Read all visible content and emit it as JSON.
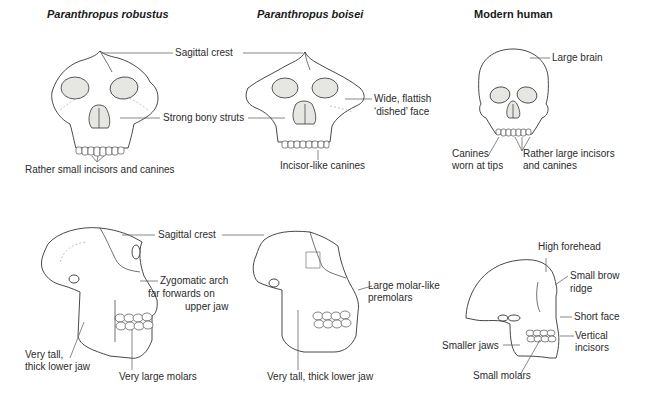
{
  "columns": [
    {
      "title": "Paranthropus robustus",
      "italic": true
    },
    {
      "title": "Paranthropus boisei",
      "italic": true
    },
    {
      "title": "Modern human",
      "italic": false
    }
  ],
  "front_view": {
    "shared_labels": {
      "sagittal_crest": "Sagittal crest",
      "strong_bony_struts": "Strong bony struts"
    },
    "robustus": {
      "teeth": "Rather small incisors and canines"
    },
    "boisei": {
      "face_line1": "Wide, flattish",
      "face_line2": "‘dished’ face",
      "teeth": "Incisor-like canines"
    },
    "human": {
      "brain": "Large brain",
      "canines_line1": "Canines",
      "canines_line2": "worn at tips",
      "incisors_line1": "Rather large incisors",
      "incisors_line2": "and canines"
    }
  },
  "side_view": {
    "shared_labels": {
      "sagittal_crest": "Sagittal crest"
    },
    "robustus": {
      "zygomatic_line1": "Zygomatic arch",
      "zygomatic_line2": "far forwards on",
      "zygomatic_line3": "upper jaw",
      "jaw_line1": "Very tall,",
      "jaw_line2": "thick lower jaw",
      "molars": "Very large molars"
    },
    "boisei": {
      "premolars_line1": "Large molar-like",
      "premolars_line2": "premolars",
      "jaw": "Very tall, thick lower jaw"
    },
    "human": {
      "forehead": "High forehead",
      "brow_line1": "Small brow",
      "brow_line2": "ridge",
      "face": "Short face",
      "incisors_line1": "Vertical",
      "incisors_line2": "incisors",
      "jaws": "Smaller jaws",
      "molars": "Small molars"
    }
  }
}
